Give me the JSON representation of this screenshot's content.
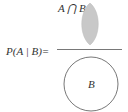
{
  "formula": {
    "lhs": "P(A | B)=",
    "numerator_label": "A ⋂ B",
    "denominator_label": "B"
  },
  "colors": {
    "lens_fill": "#c8c8c8",
    "stroke": "#555555",
    "text": "#333333"
  }
}
